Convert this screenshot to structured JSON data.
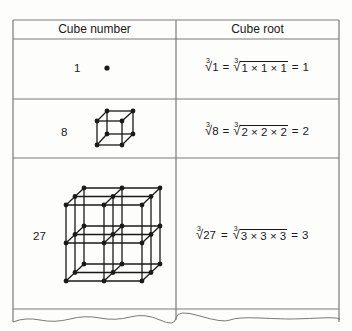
{
  "table": {
    "headers": [
      "Cube number",
      "Cube root"
    ],
    "rows": [
      {
        "number": "1",
        "figure": "single-point",
        "radicand": "1",
        "expanded": "1 × 1 × 1",
        "result": "1"
      },
      {
        "number": "8",
        "figure": "cube-2x2x2-lattice",
        "radicand": "8",
        "expanded": "2 × 2 × 2",
        "result": "2"
      },
      {
        "number": "27",
        "figure": "cube-3x3x3-lattice",
        "radicand": "27",
        "expanded": "3 × 3 × 3",
        "result": "3"
      }
    ]
  },
  "symbols": {
    "root_index": "3",
    "radical": "√",
    "equals": "="
  },
  "colors": {
    "rule": "#7a7a7a",
    "ink": "#1a1a1a",
    "paper": "#fdfdfc"
  }
}
